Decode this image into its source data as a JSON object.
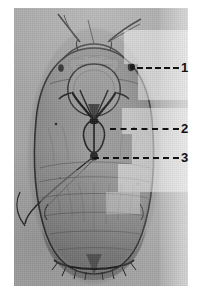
{
  "figure": {
    "kind": "micrograph",
    "background_color": "#ffffff",
    "plate": {
      "background_color": "#a6a6a6",
      "body_color": "#8a8a8a",
      "outline_color": "#2a2a2a",
      "left": 14,
      "top": 8,
      "width": 174,
      "height": 278
    },
    "annotation_color": "#111111",
    "callouts": [
      {
        "id": "callout-1",
        "label": "1",
        "anchor_x": 132,
        "anchor_y": 67,
        "line_x": 137,
        "line_y": 67,
        "line_width": 42,
        "label_x": 181,
        "label_y": 61,
        "has_anchor_dot": true
      },
      {
        "id": "callout-2",
        "label": "2",
        "anchor_x": 110,
        "anchor_y": 128,
        "line_x": 110,
        "line_y": 128,
        "line_width": 69,
        "label_x": 181,
        "label_y": 122,
        "has_anchor_dot": false
      },
      {
        "id": "callout-3",
        "label": "3",
        "anchor_x": 93,
        "anchor_y": 157,
        "line_x": 93,
        "line_y": 157,
        "line_width": 86,
        "label_x": 181,
        "label_y": 151,
        "has_anchor_dot": false
      }
    ]
  }
}
